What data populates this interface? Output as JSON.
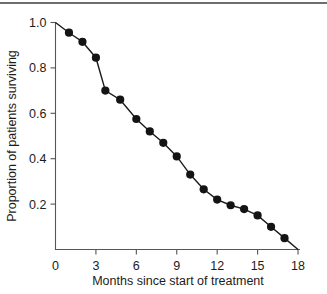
{
  "figure": {
    "background_color": "#ffffff",
    "ink_color": "#141414",
    "axis_color": "#55555a",
    "rule_color": "#6e6e72"
  },
  "chart_data": {
    "type": "line",
    "title": "",
    "xlabel": "Months since start of treatment",
    "ylabel": "Proportion of patients surviving",
    "xlim": [
      0,
      18
    ],
    "ylim": [
      0,
      1.0
    ],
    "xticks": [
      0,
      3,
      6,
      9,
      12,
      15,
      18
    ],
    "xtick_labels": [
      "0",
      "3",
      "6",
      "9",
      "12",
      "15",
      "18"
    ],
    "yticks": [
      0.2,
      0.4,
      0.6,
      0.8,
      1.0
    ],
    "ytick_labels": [
      "0.2",
      "0.4",
      "0.6",
      "0.8",
      "1.0"
    ],
    "grid": false,
    "legend": false,
    "marker": "filled-circle",
    "series": [
      {
        "name": "Survival curve",
        "x": [
          0,
          1,
          2,
          3,
          3.7,
          4.8,
          6,
          7,
          8,
          9,
          10,
          11,
          12,
          13,
          14,
          15,
          16,
          17,
          18
        ],
        "y": [
          1.0,
          0.955,
          0.915,
          0.845,
          0.7,
          0.66,
          0.575,
          0.52,
          0.47,
          0.41,
          0.33,
          0.265,
          0.22,
          0.195,
          0.178,
          0.15,
          0.1,
          0.05,
          0.0
        ],
        "marker_at_endpoints": [
          false,
          true,
          true,
          true,
          true,
          true,
          true,
          true,
          true,
          true,
          true,
          true,
          true,
          true,
          true,
          true,
          true,
          true,
          false
        ]
      }
    ]
  }
}
